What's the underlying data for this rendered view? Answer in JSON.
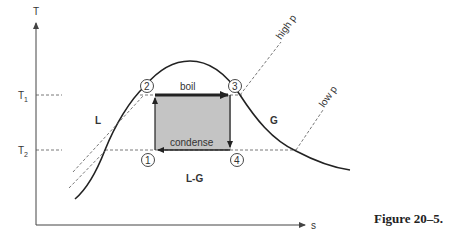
{
  "figure": {
    "caption": "Figure 20–5.",
    "axes": {
      "y_label": "T",
      "x_label": "s",
      "y_ticks": [
        {
          "label": "T",
          "sub": "1",
          "y": 95
        },
        {
          "label": "T",
          "sub": "2",
          "y": 150
        }
      ]
    },
    "regions": {
      "liquid": "L",
      "gas": "G",
      "mixture": "L-G"
    },
    "states": [
      {
        "id": "1",
        "label": "1"
      },
      {
        "id": "2",
        "label": "2"
      },
      {
        "id": "3",
        "label": "3"
      },
      {
        "id": "4",
        "label": "4"
      }
    ],
    "processes": {
      "top": "boil",
      "bottom": "condense"
    },
    "isobars": {
      "high": "high p",
      "low": "low p"
    },
    "colors": {
      "curve": "#222222",
      "cycle_fill": "#c4c4c4",
      "dashed": "#555555",
      "axis": "#444444"
    }
  }
}
